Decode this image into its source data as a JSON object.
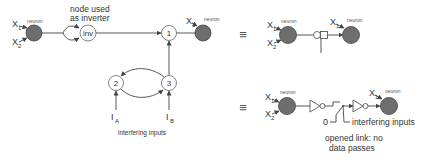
{
  "diagram": {
    "left": {
      "neuron_label": "neuron",
      "inputs": [
        {
          "name": "X",
          "sub": "1"
        },
        {
          "name": "X",
          "sub": "2"
        }
      ],
      "inverter_caption_line1": "node used",
      "inverter_caption_line2": "as inverter",
      "inverter_node_label": "inv",
      "nodes": [
        {
          "id": "1",
          "label": "1"
        },
        {
          "id": "2",
          "label": "2"
        },
        {
          "id": "3",
          "label": "3"
        }
      ],
      "output_neuron_label": "neuron",
      "output_input": {
        "name": "X",
        "sub": "1"
      },
      "interfering_inputs": [
        {
          "name": "I",
          "sub": "A"
        },
        {
          "name": "I",
          "sub": "B"
        }
      ],
      "interfering_caption": "interfering inputs"
    },
    "equivalent_symbol": "≡",
    "right_top": {
      "neuron_label": "neuron",
      "inputs": [
        {
          "name": "X",
          "sub": "1"
        },
        {
          "name": "X",
          "sub": "2"
        }
      ],
      "output_neuron_label": "neuron",
      "output_input": {
        "name": "X",
        "sub": "1"
      }
    },
    "right_bottom": {
      "neuron_label": "neuron",
      "inputs": [
        {
          "name": "X",
          "sub": "1"
        },
        {
          "name": "X",
          "sub": "2"
        }
      ],
      "zero_label": "0",
      "interfering_caption": "interfering inputs",
      "opened_link_line1": "opened link: no",
      "opened_link_line2": "data passes",
      "output_neuron_label": "neuron",
      "output_input": {
        "name": "X",
        "sub": "1"
      }
    },
    "colors": {
      "neuron_fill": "#6e6e6e",
      "line": "#444444",
      "background": "#ffffff"
    }
  }
}
